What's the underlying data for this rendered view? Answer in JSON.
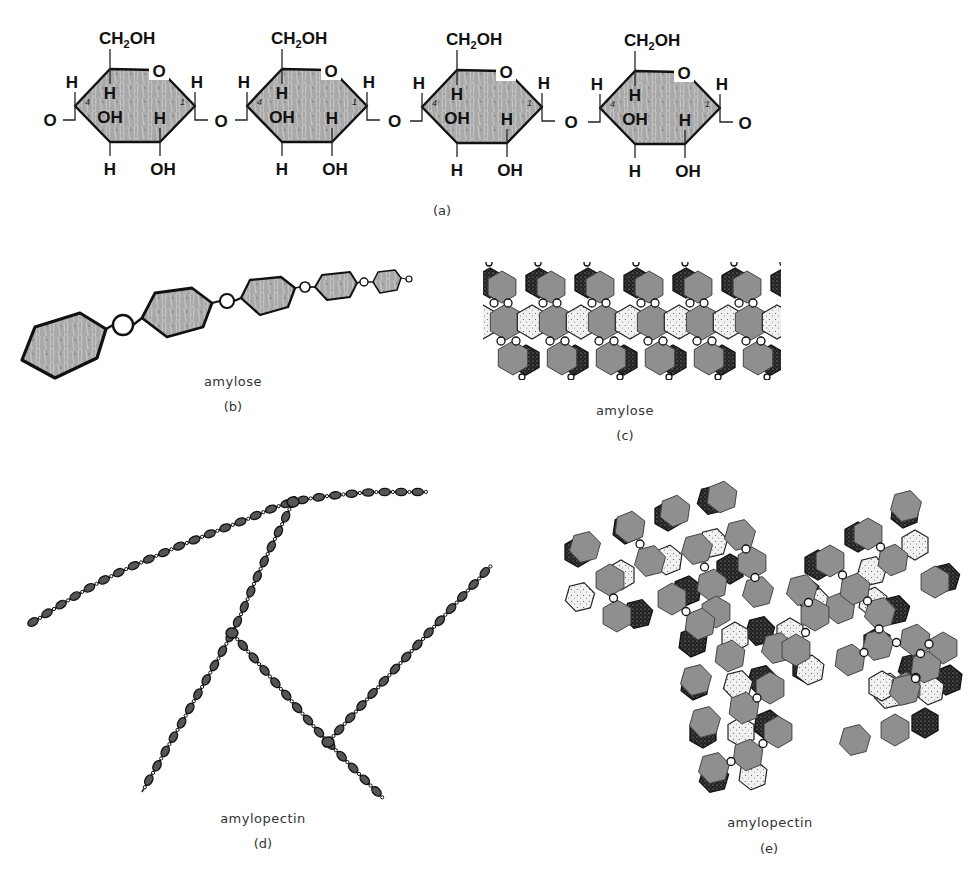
{
  "figure": {
    "colors": {
      "ring_fill": "#a8a8a8",
      "ring_stroke": "#111111",
      "bead_fill": "#555555",
      "gray_unit": "#8f8f8f",
      "background": "#ffffff"
    },
    "panel_a": {
      "label": "(a)",
      "ring_count": 4,
      "ring_origins_x": [
        75,
        247,
        422,
        600
      ],
      "ring_origins_y": [
        106,
        106,
        107,
        108
      ],
      "glycosidic_oxygen": "O",
      "terminal_left": "O",
      "terminal_right": "O",
      "ring_atoms": {
        "ch2oh_main": "CH",
        "ch2oh_sub": "2",
        "ch2oh_tail": "OH",
        "ring_oxygen": "O",
        "c4_h_up": "H",
        "c1_h_up": "H",
        "inner_h_top": "H",
        "inner_oh": "OH",
        "inner_h_right": "H",
        "bottom_h": "H",
        "bottom_oh": "OH",
        "c4_number": "4",
        "c1_number": "1"
      }
    },
    "panel_b": {
      "caption": "amylose",
      "label": "(b)",
      "hexagons": [
        [
          [
            22,
            360
          ],
          [
            35,
            327
          ],
          [
            80,
            313
          ],
          [
            106,
            329
          ],
          [
            97,
            358
          ],
          [
            55,
            378
          ]
        ],
        [
          [
            142,
            318
          ],
          [
            155,
            293
          ],
          [
            192,
            288
          ],
          [
            212,
            303
          ],
          [
            203,
            327
          ],
          [
            167,
            337
          ]
        ],
        [
          [
            241,
            298
          ],
          [
            250,
            280
          ],
          [
            281,
            277
          ],
          [
            295,
            288
          ],
          [
            288,
            307
          ],
          [
            260,
            315
          ]
        ],
        [
          [
            315,
            287
          ],
          [
            322,
            275
          ],
          [
            350,
            272
          ],
          [
            357,
            283
          ],
          [
            350,
            297
          ],
          [
            327,
            300
          ]
        ],
        [
          [
            373,
            282
          ],
          [
            378,
            272
          ],
          [
            395,
            270
          ],
          [
            401,
            278
          ],
          [
            397,
            290
          ],
          [
            380,
            293
          ]
        ]
      ],
      "hex_stroke_widths": [
        3.2,
        2.8,
        2.3,
        1.9,
        1.5
      ],
      "circles": [
        {
          "cx": 123,
          "cy": 325,
          "r": 10,
          "sw": 2.4
        },
        {
          "cx": 227,
          "cy": 301,
          "r": 7,
          "sw": 2
        },
        {
          "cx": 305,
          "cy": 287,
          "r": 5,
          "sw": 1.7
        },
        {
          "cx": 364,
          "cy": 282,
          "r": 4,
          "sw": 1.4
        },
        {
          "cx": 409,
          "cy": 279,
          "r": 3,
          "sw": 1.2
        }
      ]
    },
    "panel_c": {
      "caption": "amylose",
      "label": "(c)",
      "clip": {
        "x": 483,
        "y": 262,
        "w": 298,
        "h": 118
      },
      "period": 49,
      "repeats": 7,
      "start_x": 456
    },
    "panel_d": {
      "caption": "amylopectin",
      "label": "(d)",
      "chains": [
        {
          "name": "main-chain",
          "points": [
            [
              33,
              622
            ],
            [
              100,
              582
            ],
            [
              170,
              550
            ],
            [
              240,
              522
            ],
            [
              293,
              502
            ],
            [
              360,
              493
            ],
            [
              418,
              492
            ]
          ]
        },
        {
          "name": "branch-1",
          "points": [
            [
              293,
              502
            ],
            [
              262,
              566
            ],
            [
              232,
              633
            ],
            [
              190,
              708
            ],
            [
              142,
              792
            ]
          ]
        },
        {
          "name": "branch-2",
          "points": [
            [
              232,
              633
            ],
            [
              280,
              688
            ],
            [
              328,
              742
            ],
            [
              378,
              793
            ]
          ]
        },
        {
          "name": "branch-3",
          "points": [
            [
              328,
              742
            ],
            [
              408,
              655
            ],
            [
              488,
              569
            ]
          ]
        }
      ],
      "branch_points": [
        [
          293,
          502
        ],
        [
          232,
          633
        ],
        [
          328,
          742
        ]
      ]
    },
    "panel_e": {
      "caption": "amylopectin",
      "label": "(e)",
      "units": [
        {
          "t": "dark",
          "x": 578,
          "y": 552
        },
        {
          "t": "gray",
          "x": 585,
          "y": 547
        },
        {
          "t": "dot",
          "x": 580,
          "y": 597
        },
        {
          "t": "gray",
          "x": 610,
          "y": 580
        },
        {
          "t": "dark",
          "x": 627,
          "y": 529
        },
        {
          "t": "gray",
          "x": 630,
          "y": 527
        },
        {
          "t": "dot",
          "x": 621,
          "y": 575
        },
        {
          "t": "gray",
          "x": 650,
          "y": 561
        },
        {
          "t": "dark",
          "x": 638,
          "y": 614
        },
        {
          "t": "gray",
          "x": 617,
          "y": 616
        },
        {
          "t": "dark",
          "x": 668,
          "y": 516
        },
        {
          "t": "gray",
          "x": 675,
          "y": 511
        },
        {
          "t": "dot",
          "x": 668,
          "y": 560
        },
        {
          "t": "gray",
          "x": 697,
          "y": 549
        },
        {
          "t": "dark",
          "x": 687,
          "y": 591
        },
        {
          "t": "gray",
          "x": 672,
          "y": 599
        },
        {
          "t": "dark",
          "x": 712,
          "y": 500
        },
        {
          "t": "gray",
          "x": 722,
          "y": 497
        },
        {
          "t": "dot",
          "x": 713,
          "y": 543
        },
        {
          "t": "gray",
          "x": 740,
          "y": 535
        },
        {
          "t": "dark",
          "x": 730,
          "y": 569
        },
        {
          "t": "gray",
          "x": 752,
          "y": 563
        },
        {
          "t": "gray",
          "x": 712,
          "y": 585
        },
        {
          "t": "gray",
          "x": 758,
          "y": 592
        },
        {
          "t": "gray",
          "x": 716,
          "y": 612
        },
        {
          "t": "gray",
          "x": 700,
          "y": 624
        },
        {
          "t": "dark",
          "x": 693,
          "y": 642
        },
        {
          "t": "dot",
          "x": 735,
          "y": 637
        },
        {
          "t": "dark",
          "x": 760,
          "y": 631
        },
        {
          "t": "gray",
          "x": 777,
          "y": 648
        },
        {
          "t": "gray",
          "x": 796,
          "y": 650
        },
        {
          "t": "dark",
          "x": 806,
          "y": 668
        },
        {
          "t": "dot",
          "x": 810,
          "y": 670
        },
        {
          "t": "gray",
          "x": 730,
          "y": 656
        },
        {
          "t": "dark",
          "x": 695,
          "y": 685
        },
        {
          "t": "gray",
          "x": 696,
          "y": 680
        },
        {
          "t": "dot",
          "x": 738,
          "y": 685
        },
        {
          "t": "dark",
          "x": 762,
          "y": 680
        },
        {
          "t": "gray",
          "x": 770,
          "y": 688
        },
        {
          "t": "gray",
          "x": 744,
          "y": 708
        },
        {
          "t": "gray",
          "x": 705,
          "y": 722
        },
        {
          "t": "dark",
          "x": 703,
          "y": 733
        },
        {
          "t": "dot",
          "x": 741,
          "y": 732
        },
        {
          "t": "dark",
          "x": 768,
          "y": 725
        },
        {
          "t": "gray",
          "x": 778,
          "y": 732
        },
        {
          "t": "gray",
          "x": 748,
          "y": 755
        },
        {
          "t": "gray",
          "x": 714,
          "y": 768
        },
        {
          "t": "dark",
          "x": 714,
          "y": 778
        },
        {
          "t": "dot",
          "x": 753,
          "y": 775
        },
        {
          "t": "dark",
          "x": 818,
          "y": 565
        },
        {
          "t": "gray",
          "x": 830,
          "y": 561
        },
        {
          "t": "dot",
          "x": 816,
          "y": 603
        },
        {
          "t": "gray",
          "x": 840,
          "y": 608
        },
        {
          "t": "dark",
          "x": 805,
          "y": 592
        },
        {
          "t": "gray",
          "x": 802,
          "y": 590
        },
        {
          "t": "dot",
          "x": 790,
          "y": 633
        },
        {
          "t": "gray",
          "x": 815,
          "y": 615
        },
        {
          "t": "gray",
          "x": 855,
          "y": 589
        },
        {
          "t": "dot",
          "x": 873,
          "y": 602
        },
        {
          "t": "dark",
          "x": 895,
          "y": 610
        },
        {
          "t": "gray",
          "x": 880,
          "y": 613
        },
        {
          "t": "dark",
          "x": 858,
          "y": 537
        },
        {
          "t": "gray",
          "x": 868,
          "y": 534
        },
        {
          "t": "dot",
          "x": 872,
          "y": 571
        },
        {
          "t": "gray",
          "x": 893,
          "y": 560
        },
        {
          "t": "dark",
          "x": 905,
          "y": 513
        },
        {
          "t": "gray",
          "x": 906,
          "y": 506
        },
        {
          "t": "dot",
          "x": 915,
          "y": 545
        },
        {
          "t": "gray",
          "x": 935,
          "y": 582
        },
        {
          "t": "dark",
          "x": 945,
          "y": 578
        },
        {
          "t": "gray",
          "x": 915,
          "y": 640
        },
        {
          "t": "dot",
          "x": 888,
          "y": 688
        },
        {
          "t": "dark",
          "x": 877,
          "y": 643
        },
        {
          "t": "gray",
          "x": 878,
          "y": 645
        },
        {
          "t": "gray",
          "x": 943,
          "y": 648
        },
        {
          "t": "dark",
          "x": 918,
          "y": 672
        },
        {
          "t": "gray",
          "x": 850,
          "y": 660
        },
        {
          "t": "gray",
          "x": 855,
          "y": 740
        },
        {
          "t": "dot",
          "x": 889,
          "y": 694
        },
        {
          "t": "gray",
          "x": 906,
          "y": 688
        },
        {
          "t": "dark",
          "x": 913,
          "y": 668
        },
        {
          "t": "gray",
          "x": 926,
          "y": 667
        },
        {
          "t": "dot",
          "x": 882,
          "y": 686
        },
        {
          "t": "gray",
          "x": 905,
          "y": 690
        },
        {
          "t": "dark",
          "x": 925,
          "y": 723
        },
        {
          "t": "gray",
          "x": 895,
          "y": 730
        },
        {
          "t": "dot",
          "x": 930,
          "y": 690
        },
        {
          "t": "dark",
          "x": 948,
          "y": 680
        }
      ]
    }
  }
}
